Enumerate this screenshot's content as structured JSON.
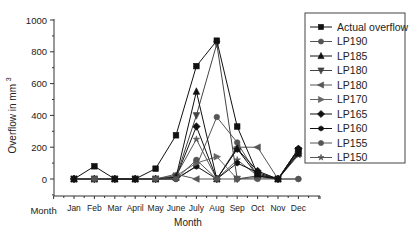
{
  "chart_data": {
    "type": "line",
    "title": "",
    "xlabel": "Month",
    "ylabel": "Overflow in mm",
    "ylabel_superscript": "3",
    "ylim": [
      -100,
      1000
    ],
    "yticks": [
      0,
      200,
      400,
      600,
      800,
      1000
    ],
    "x_axis_first_label": "Month",
    "categories": [
      "Jan",
      "Feb",
      "Mar",
      "April",
      "May",
      "June",
      "July",
      "Aug",
      "Sep",
      "Oct",
      "Nov",
      "Dec"
    ],
    "legend_position": "right",
    "grid": false,
    "series": [
      {
        "name": "Actual overflow",
        "marker": "square",
        "color": "#111111",
        "values": [
          0,
          80,
          0,
          0,
          65,
          275,
          710,
          870,
          330,
          30,
          0,
          180
        ]
      },
      {
        "name": "LP190",
        "marker": "circle",
        "color": "#555555",
        "values": [
          0,
          0,
          0,
          0,
          0,
          0,
          120,
          0,
          0,
          0,
          0,
          0
        ]
      },
      {
        "name": "LP185",
        "marker": "triangle-up",
        "color": "#111111",
        "values": [
          0,
          0,
          0,
          0,
          0,
          10,
          550,
          0,
          190,
          20,
          0,
          160
        ]
      },
      {
        "name": "LP180",
        "marker": "triangle-down",
        "color": "#444444",
        "values": [
          0,
          0,
          0,
          0,
          0,
          10,
          400,
          850,
          0,
          20,
          0,
          170
        ]
      },
      {
        "name": "LP180",
        "marker": "triangle-left",
        "color": "#555555",
        "values": [
          0,
          0,
          0,
          0,
          0,
          30,
          0,
          0,
          200,
          200,
          0,
          170
        ]
      },
      {
        "name": "LP170",
        "marker": "triangle-right",
        "color": "#666666",
        "values": [
          0,
          0,
          0,
          0,
          0,
          20,
          100,
          140,
          0,
          10,
          0,
          160
        ]
      },
      {
        "name": "LP165",
        "marker": "diamond",
        "color": "#111111",
        "values": [
          0,
          0,
          0,
          0,
          0,
          10,
          330,
          0,
          190,
          50,
          0,
          190
        ]
      },
      {
        "name": "LP160",
        "marker": "hexagon",
        "color": "#111111",
        "values": [
          0,
          0,
          0,
          0,
          0,
          0,
          80,
          0,
          100,
          40,
          0,
          190
        ]
      },
      {
        "name": "LP155",
        "marker": "circle",
        "color": "#555555",
        "values": [
          0,
          0,
          0,
          0,
          0,
          0,
          80,
          390,
          230,
          20,
          0,
          0
        ]
      },
      {
        "name": "LP150",
        "marker": "star",
        "color": "#555555",
        "values": [
          0,
          0,
          0,
          0,
          0,
          20,
          250,
          0,
          120,
          20,
          0,
          150
        ]
      }
    ]
  }
}
